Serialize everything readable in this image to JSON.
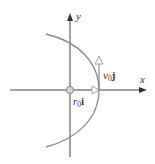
{
  "diagram": {
    "axes": {
      "x_label": "x",
      "y_label": "y"
    },
    "vectors": {
      "position": {
        "scalar": "r",
        "subscript": "0",
        "unit": "i"
      },
      "velocity": {
        "scalar": "v",
        "subscript": "0",
        "unit": "j"
      }
    },
    "colors": {
      "axes": "#444444",
      "curve": "#8a8a8a",
      "vector_outline": "#888888",
      "origin_fill": "#d8d8d8",
      "text": "#333333"
    }
  }
}
